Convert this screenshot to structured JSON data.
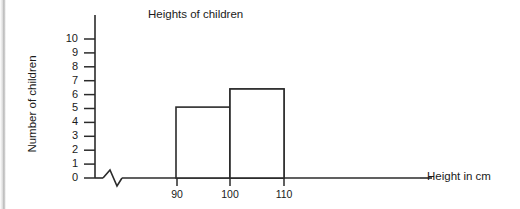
{
  "chart_data": {
    "type": "bar",
    "title": "Heights of children",
    "xlabel": "Height in cm",
    "ylabel": "Number of children",
    "grid": false,
    "legend": "none",
    "axis_break": "x-axis has a zigzag break symbol between the origin and the first bar",
    "bar_style": "unfilled white bars with black outlines (histogram)",
    "categories": [
      "80-90",
      "90-100",
      "100-110"
    ],
    "bin_edges": [
      80,
      90,
      100,
      110
    ],
    "values": [
      9.2,
      5.1,
      6.4
    ],
    "x": [
      90,
      100,
      110
    ],
    "xlim": [
      80,
      110
    ],
    "ylim": [
      0,
      10
    ],
    "ytick_labels": [
      "0",
      "1",
      "2",
      "3",
      "4",
      "5",
      "6",
      "7",
      "8",
      "9",
      "10"
    ],
    "ytick_values": [
      0,
      1,
      2,
      3,
      4,
      5,
      6,
      7,
      8,
      9,
      10
    ],
    "xtick_labels": [
      "90",
      "100",
      "110"
    ],
    "xtick_values": [
      90,
      100,
      110
    ]
  },
  "axes": {
    "title": "Heights of children",
    "x_title": "Height in cm",
    "y_title": "Number of children"
  },
  "colors": {
    "ink": "#1a1a1a",
    "bar_fill": "#ffffff",
    "bar_stroke": "#2b2b2b",
    "background": "#ffffff"
  }
}
